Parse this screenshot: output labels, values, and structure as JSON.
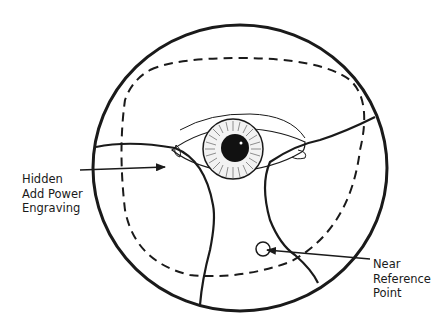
{
  "figure": {
    "labels": {
      "hidden_add_power": [
        "Hidden",
        "Add Power",
        "Engraving"
      ],
      "near_reference": [
        "Near",
        "Reference",
        "Point"
      ]
    },
    "colors": {
      "stroke": "#1a1a1a",
      "background": "#ffffff"
    }
  }
}
